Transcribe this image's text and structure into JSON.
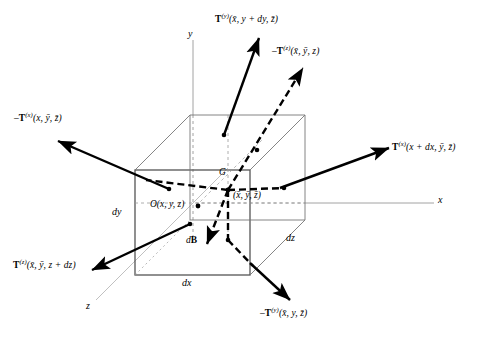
{
  "figure": {
    "type": "diagram",
    "background": "#ffffff",
    "stroke_color": "#000000",
    "cube_edge_color": "#555555",
    "dashed_color": "#999999",
    "width": 481,
    "height": 341
  },
  "axes": [
    {
      "name": "y-axis",
      "label": "y",
      "x": 190,
      "y": 30
    },
    {
      "name": "x-axis",
      "label": "x",
      "x": 440,
      "y": 196
    },
    {
      "name": "z-axis",
      "label": "z",
      "x": 88,
      "y": 303
    }
  ],
  "points": [
    {
      "name": "origin-point",
      "label": "O(x, y, z)",
      "x": 152,
      "y": 196
    },
    {
      "name": "centroid-point",
      "label": "G",
      "x": 222,
      "y": 171
    },
    {
      "name": "centroid-coords",
      "label": "(x̄, ȳ, z̄)",
      "x": 234,
      "y": 192
    }
  ],
  "dimensions": [
    {
      "name": "dim-dy",
      "label": "dy",
      "x": 113,
      "y": 207
    },
    {
      "name": "dim-dx",
      "label": "dx",
      "x": 183,
      "y": 277
    },
    {
      "name": "dim-dz",
      "label": "dz",
      "x": 287,
      "y": 233
    }
  ],
  "body_force": {
    "name": "body-force",
    "label_prefix": "d",
    "label_bold": "B",
    "x": 188,
    "y": 236
  },
  "traction_labels": [
    {
      "name": "traction-y-top",
      "text": "T(y)(x̄, y + dy, z̄)",
      "prefix": "",
      "symbol": "T",
      "superscript": "(y)",
      "args": "(x̄, y + dy, z̄)",
      "x": 215,
      "y": 14
    },
    {
      "name": "traction-z-negative",
      "text": "−T(z)(x̄, ȳ, z)",
      "prefix": "–",
      "symbol": "T",
      "superscript": "(z)",
      "args": "(x̄, ȳ, z)",
      "x": 272,
      "y": 46
    },
    {
      "name": "traction-x-negative",
      "text": "−T(x)(x, ȳ, z̄)",
      "prefix": "–",
      "symbol": "T",
      "superscript": "(x)",
      "args": "(x, ȳ, z̄)",
      "x": 14,
      "y": 113
    },
    {
      "name": "traction-x-positive",
      "text": "T(x)(x + dx, ȳ, z̄)",
      "prefix": "",
      "symbol": "T",
      "superscript": "(x)",
      "args": "(x + dx, ȳ, z̄)",
      "x": 392,
      "y": 142
    },
    {
      "name": "traction-z-positive",
      "text": "T(z)(x̄, ȳ, z + dz)",
      "prefix": "",
      "symbol": "T",
      "superscript": "(z)",
      "args": "(x̄, ȳ, z + dz)",
      "x": 13,
      "y": 260
    },
    {
      "name": "traction-y-negative",
      "text": "−T(y)(x̄, y, z̄)",
      "prefix": "–",
      "symbol": "T",
      "superscript": "(y)",
      "args": "(x̄, y, z̄)",
      "x": 260,
      "y": 308
    }
  ]
}
